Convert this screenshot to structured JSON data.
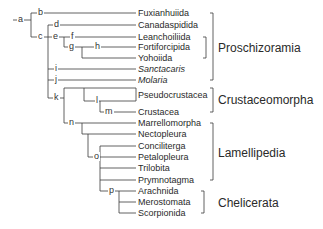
{
  "diagram": {
    "type": "cladogram",
    "taxa": [
      {
        "name": "Fuxianhuiida",
        "italic": false
      },
      {
        "name": "Canadaspidida",
        "italic": false
      },
      {
        "name": "Leanchoiliida",
        "italic": false
      },
      {
        "name": "Fortiforcipida",
        "italic": false
      },
      {
        "name": "Yohoiida",
        "italic": false
      },
      {
        "name": "Sanctacaris",
        "italic": true
      },
      {
        "name": "Molaria",
        "italic": true
      },
      {
        "name": "Pseudocrustacea",
        "italic": false
      },
      {
        "name": "Crustacea",
        "italic": false
      },
      {
        "name": "Marrellomorpha",
        "italic": false
      },
      {
        "name": "Nectopleura",
        "italic": false
      },
      {
        "name": "Conciliterga",
        "italic": false
      },
      {
        "name": "Petalopleura",
        "italic": false
      },
      {
        "name": "Trilobita",
        "italic": false
      },
      {
        "name": "Prymnotagma",
        "italic": false
      },
      {
        "name": "Arachnida",
        "italic": false
      },
      {
        "name": "Merostomata",
        "italic": false
      },
      {
        "name": "Scorpionida",
        "italic": false
      }
    ],
    "nodes": [
      "a",
      "b",
      "c",
      "d",
      "e",
      "f",
      "g",
      "h",
      "i",
      "j",
      "k",
      "l",
      "m",
      "n",
      "o",
      "p"
    ],
    "groups": [
      {
        "name": "Proschizoramia"
      },
      {
        "name": "Crustaceomorpha"
      },
      {
        "name": "Lamellipedia"
      },
      {
        "name": "Chelicerata"
      }
    ],
    "line_color": "#3a3a3a"
  }
}
